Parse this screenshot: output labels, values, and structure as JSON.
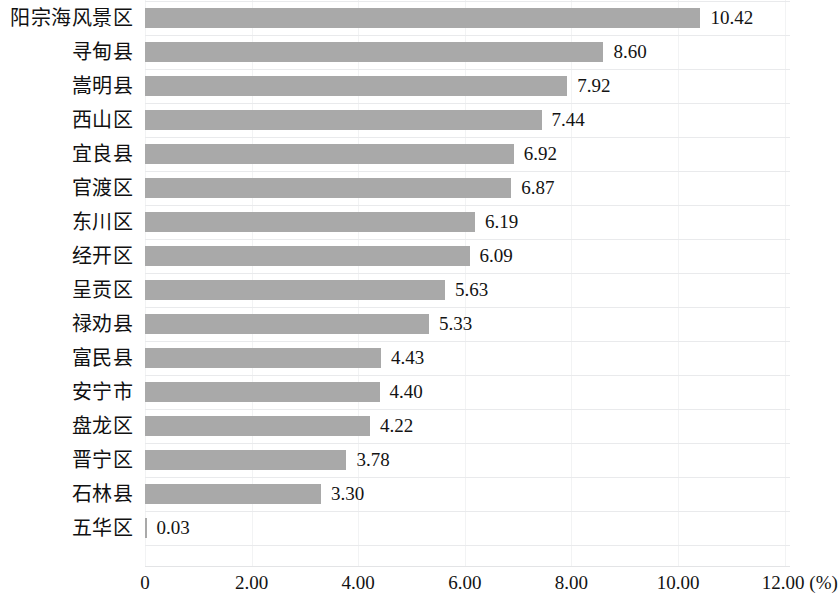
{
  "chart_data": {
    "type": "bar",
    "orientation": "horizontal",
    "title": "",
    "subtitle": "",
    "xlabel": "(%)",
    "ylabel": "",
    "xlim": [
      0,
      12
    ],
    "grid": true,
    "legend": null,
    "bar_color": "#a9a9a9",
    "axis_unit_label": "(%)",
    "xticks": [
      "0",
      "2.00",
      "4.00",
      "6.00",
      "8.00",
      "10.00",
      "12.00 (%)"
    ],
    "xtick_values": [
      0,
      2,
      4,
      6,
      8,
      10,
      12
    ],
    "categories": [
      "阳宗海风景区",
      "寻甸县",
      "嵩明县",
      "西山区",
      "宜良县",
      "官渡区",
      "东川区",
      "经开区",
      "呈贡区",
      "禄劝县",
      "富民县",
      "安宁市",
      "盘龙区",
      "晋宁区",
      "石林县",
      "五华区"
    ],
    "values": [
      10.42,
      8.6,
      7.92,
      7.44,
      6.92,
      6.87,
      6.19,
      6.09,
      5.63,
      5.33,
      4.43,
      4.4,
      4.22,
      3.78,
      3.3,
      0.03
    ],
    "value_labels": [
      "10.42",
      "8.60",
      "7.92",
      "7.44",
      "6.92",
      "6.87",
      "6.19",
      "6.09",
      "5.63",
      "5.33",
      "4.43",
      "4.40",
      "4.22",
      "3.78",
      "3.30",
      "0.03"
    ]
  }
}
